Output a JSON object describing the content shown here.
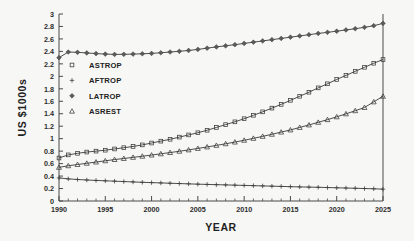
{
  "chart_data": {
    "type": "line",
    "title": "",
    "xlabel": "YEAR",
    "ylabel": "US $1000s",
    "xlim": [
      1990,
      2025
    ],
    "ylim": [
      0,
      3
    ],
    "grid": false,
    "legend_position": "upper-left-inside",
    "x_tick_labels": [
      "1990",
      "1995",
      "2000",
      "2005",
      "2010",
      "2015",
      "2020",
      "2025"
    ],
    "x_major_ticks": [
      1990,
      1995,
      2000,
      2005,
      2010,
      2015,
      2020,
      2025
    ],
    "x_minor_tick_interval": 1,
    "y_tick_labels": [
      "0",
      "0.2",
      "0.4",
      "0.6",
      "0.8",
      "1",
      "1.2",
      "1.4",
      "1.6",
      "1.8",
      "2",
      "2.2",
      "2.4",
      "2.6",
      "2.8",
      "3"
    ],
    "y_major_ticks": [
      0,
      0.2,
      0.4,
      0.6,
      0.8,
      1,
      1.2,
      1.4,
      1.6,
      1.8,
      2,
      2.2,
      2.4,
      2.6,
      2.8,
      3
    ],
    "x": [
      1990,
      1991,
      1992,
      1993,
      1994,
      1995,
      1996,
      1997,
      1998,
      1999,
      2000,
      2001,
      2002,
      2003,
      2004,
      2005,
      2006,
      2007,
      2008,
      2009,
      2010,
      2011,
      2012,
      2013,
      2014,
      2015,
      2016,
      2017,
      2018,
      2019,
      2020,
      2021,
      2022,
      2023,
      2024,
      2025
    ],
    "series": [
      {
        "name": "ASTROP",
        "marker": "square",
        "values": [
          0.69,
          0.74,
          0.765,
          0.785,
          0.8,
          0.815,
          0.835,
          0.855,
          0.875,
          0.9,
          0.93,
          0.96,
          0.99,
          1.025,
          1.06,
          1.095,
          1.135,
          1.18,
          1.225,
          1.27,
          1.32,
          1.375,
          1.43,
          1.49,
          1.55,
          1.615,
          1.68,
          1.745,
          1.815,
          1.88,
          1.95,
          2.015,
          2.08,
          2.145,
          2.21,
          2.27
        ]
      },
      {
        "name": "AFTROP",
        "marker": "plus",
        "values": [
          0.37,
          0.355,
          0.345,
          0.337,
          0.33,
          0.324,
          0.318,
          0.312,
          0.306,
          0.3,
          0.295,
          0.29,
          0.285,
          0.28,
          0.275,
          0.27,
          0.266,
          0.262,
          0.258,
          0.254,
          0.25,
          0.246,
          0.242,
          0.238,
          0.234,
          0.23,
          0.226,
          0.223,
          0.22,
          0.216,
          0.212,
          0.208,
          0.204,
          0.2,
          0.196,
          0.19
        ]
      },
      {
        "name": "LATROP",
        "marker": "diamond",
        "values": [
          2.3,
          2.39,
          2.385,
          2.375,
          2.365,
          2.357,
          2.352,
          2.353,
          2.357,
          2.362,
          2.368,
          2.378,
          2.39,
          2.402,
          2.415,
          2.432,
          2.452,
          2.472,
          2.49,
          2.508,
          2.528,
          2.548,
          2.568,
          2.588,
          2.608,
          2.628,
          2.648,
          2.668,
          2.688,
          2.706,
          2.724,
          2.744,
          2.764,
          2.786,
          2.812,
          2.85
        ]
      },
      {
        "name": "ASREST",
        "marker": "triangle",
        "values": [
          0.54,
          0.565,
          0.585,
          0.605,
          0.625,
          0.645,
          0.665,
          0.682,
          0.7,
          0.718,
          0.737,
          0.757,
          0.777,
          0.798,
          0.82,
          0.843,
          0.867,
          0.892,
          0.918,
          0.945,
          0.974,
          1.005,
          1.037,
          1.07,
          1.105,
          1.14,
          1.18,
          1.22,
          1.262,
          1.305,
          1.35,
          1.398,
          1.448,
          1.5,
          1.59,
          1.68
        ]
      }
    ],
    "legend_entries": [
      {
        "label": "ASTROP",
        "marker": "square"
      },
      {
        "label": "AFTROP",
        "marker": "plus"
      },
      {
        "label": "LATROP",
        "marker": "diamond"
      },
      {
        "label": "ASREST",
        "marker": "triangle"
      }
    ]
  }
}
